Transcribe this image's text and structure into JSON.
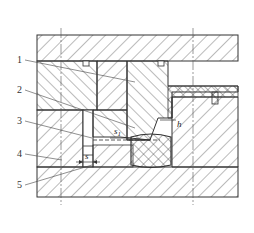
{
  "diagram": {
    "type": "mold cross-section (technical drawing)",
    "callouts": [
      {
        "id": "1",
        "label": "1"
      },
      {
        "id": "2",
        "label": "2"
      },
      {
        "id": "3",
        "label": "3"
      },
      {
        "id": "4",
        "label": "4"
      },
      {
        "id": "5",
        "label": "5"
      }
    ],
    "dimensions": {
      "s1": "s",
      "s1_sub": "1",
      "s": "s",
      "h": "h"
    },
    "colors": {
      "line": "#333333",
      "hatch": "#555555",
      "background": "#ffffff"
    }
  }
}
